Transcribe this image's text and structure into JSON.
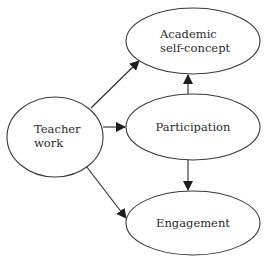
{
  "diagram": {
    "type": "path-diagram",
    "colors": {
      "stroke": "#3a3a3a",
      "text": "#2b2b2b",
      "background": "#ffffff"
    },
    "nodes": [
      {
        "id": "teacher",
        "lines": [
          "Teacher",
          "work"
        ],
        "cx": 55,
        "cy": 137,
        "rx": 48,
        "ry": 40
      },
      {
        "id": "academic",
        "lines": [
          "Academic",
          "self-concept"
        ],
        "cx": 193,
        "cy": 41,
        "rx": 67,
        "ry": 33
      },
      {
        "id": "participation",
        "lines": [
          "Participation"
        ],
        "cx": 193,
        "cy": 127,
        "rx": 67,
        "ry": 33
      },
      {
        "id": "engagement",
        "lines": [
          "Engagement"
        ],
        "cx": 193,
        "cy": 223,
        "rx": 67,
        "ry": 32
      }
    ],
    "edges": [
      {
        "from": "teacher",
        "to": "academic"
      },
      {
        "from": "teacher",
        "to": "participation"
      },
      {
        "from": "teacher",
        "to": "engagement"
      },
      {
        "from": "participation",
        "to": "academic"
      },
      {
        "from": "participation",
        "to": "engagement"
      }
    ]
  }
}
